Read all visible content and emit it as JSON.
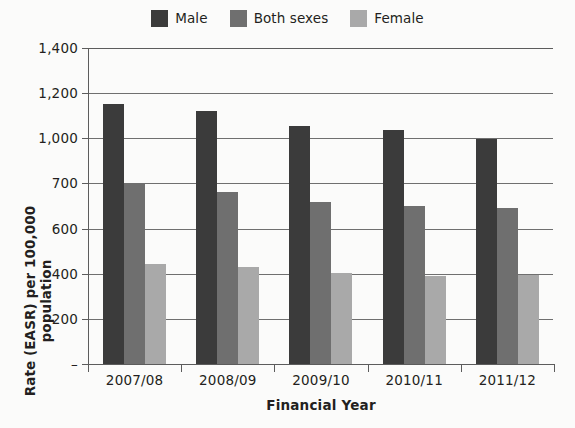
{
  "chart_data": {
    "type": "bar",
    "title": "",
    "xlabel": "Financial Year",
    "ylabel": "Rate (EASR) per 100,000 population",
    "categories": [
      "2007/08",
      "2008/09",
      "2009/10",
      "2010/11",
      "2011/12"
    ],
    "series": [
      {
        "name": "Male",
        "color": "#3b3b3b",
        "values": [
          1150,
          1120,
          1055,
          1035,
          995
        ]
      },
      {
        "name": "Both sexes",
        "color": "#6f6f6f",
        "values": [
          700,
          680,
          660,
          650,
          645
        ]
      },
      {
        "name": "Female",
        "color": "#a9a9a9",
        "values": [
          445,
          430,
          405,
          390,
          395
        ]
      }
    ],
    "ytick_labels": [
      "1,400",
      "1,200",
      "1,000",
      "700",
      "600",
      "400",
      "200",
      "–"
    ],
    "ytick_values": [
      1400,
      1200,
      1000,
      700,
      600,
      400,
      200,
      0
    ],
    "ylim": [
      0,
      1400
    ],
    "grid": true,
    "legend_position": "top-center"
  },
  "legend": {
    "items": [
      {
        "label": "Male",
        "color": "#3b3b3b",
        "swatch_name": "legend-swatch-male"
      },
      {
        "label": "Both sexes",
        "color": "#6f6f6f",
        "swatch_name": "legend-swatch-both-sexes"
      },
      {
        "label": "Female",
        "color": "#a9a9a9",
        "swatch_name": "legend-swatch-female"
      }
    ]
  },
  "axes": {
    "y_title": "Rate (EASR) per 100,000 population",
    "x_title": "Financial Year"
  }
}
